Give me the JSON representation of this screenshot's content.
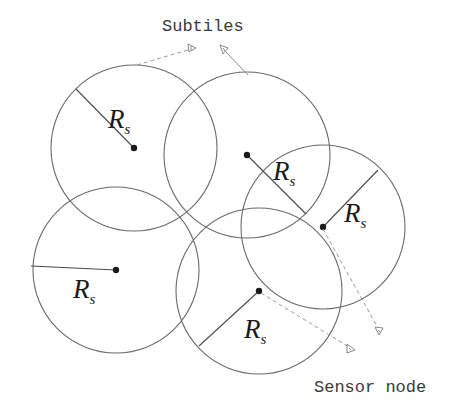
{
  "diagram": {
    "labels": {
      "subtiles": "Subtiles",
      "sensor_node": "Sensor node",
      "radius_symbol": "R",
      "radius_subscript": "s"
    },
    "circles": [
      {
        "id": "A",
        "cx": 134,
        "cy": 148,
        "r": 83,
        "radius_end": [
          77,
          87
        ],
        "label_pos": [
          109,
          126
        ]
      },
      {
        "id": "B",
        "cx": 247,
        "cy": 155,
        "r": 83,
        "radius_end": [
          305,
          213
        ],
        "label_pos": [
          274,
          178
        ]
      },
      {
        "id": "C",
        "cx": 323,
        "cy": 227,
        "r": 82,
        "radius_end": [
          377,
          170
        ],
        "label_pos": [
          344,
          221
        ]
      },
      {
        "id": "D",
        "cx": 116,
        "cy": 270,
        "r": 83,
        "radius_end": [
          30,
          266
        ],
        "label_pos": [
          73,
          298
        ]
      },
      {
        "id": "E",
        "cx": 259,
        "cy": 291,
        "r": 83,
        "radius_end": [
          200,
          346
        ],
        "label_pos": [
          244,
          336
        ]
      }
    ],
    "colors": {
      "circle_stroke": "#6a6a6a",
      "node_fill": "#1a1a1a",
      "leader_stroke": "#8a8a8a",
      "text": "#3a3a3a"
    }
  }
}
